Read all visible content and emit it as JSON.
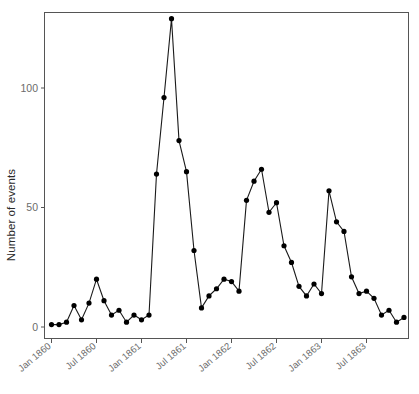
{
  "chart_data": {
    "type": "line",
    "title": "",
    "xlabel": "",
    "ylabel": "Number of events",
    "ylim": [
      0,
      133
    ],
    "yticks": [
      0,
      50,
      100
    ],
    "ytick_labels": [
      "0",
      "50",
      "100"
    ],
    "xtick_labels": [
      "Jan 1860",
      "Jul 1860",
      "Jan 1861",
      "Jul 1861",
      "Jan 1862",
      "Jul 1862",
      "Jan 1863",
      "Jul 1863"
    ],
    "xtick_index": [
      0,
      6,
      12,
      18,
      24,
      30,
      36,
      42
    ],
    "grid": false,
    "legend": null,
    "marker": "filled-circle",
    "line_color": "#1a1a1a",
    "marker_color": "#000000",
    "x": [
      "Jan 1860",
      "Feb 1860",
      "Mar 1860",
      "Apr 1860",
      "May 1860",
      "Jun 1860",
      "Jul 1860",
      "Aug 1860",
      "Sep 1860",
      "Oct 1860",
      "Nov 1860",
      "Dec 1860",
      "Jan 1861",
      "Feb 1861",
      "Mar 1861",
      "Apr 1861",
      "May 1861",
      "Jun 1861",
      "Jul 1861",
      "Aug 1861",
      "Sep 1861",
      "Oct 1861",
      "Nov 1861",
      "Dec 1861",
      "Jan 1862",
      "Feb 1862",
      "Mar 1862",
      "Apr 1862",
      "May 1862",
      "Jun 1862",
      "Jul 1862",
      "Aug 1862",
      "Sep 1862",
      "Oct 1862",
      "Nov 1862",
      "Dec 1862",
      "Jan 1863",
      "Feb 1863",
      "Mar 1863",
      "Apr 1863",
      "May 1863",
      "Jun 1863",
      "Jul 1863",
      "Aug 1863",
      "Sep 1863",
      "Oct 1863",
      "Nov 1863",
      "Dec 1863"
    ],
    "values": [
      1,
      1,
      2,
      9,
      3,
      10,
      20,
      11,
      5,
      7,
      2,
      5,
      3,
      5,
      64,
      96,
      129,
      78,
      65,
      32,
      8,
      13,
      16,
      20,
      19,
      15,
      53,
      61,
      66,
      48,
      52,
      34,
      27,
      17,
      13,
      18,
      14,
      57,
      44,
      40,
      21,
      14,
      15,
      12,
      5,
      7,
      2,
      4
    ],
    "values_note": "monthly counts read from marker positions"
  },
  "axes": {
    "y_axis_name": "Number of events",
    "x_axis_name": ""
  }
}
